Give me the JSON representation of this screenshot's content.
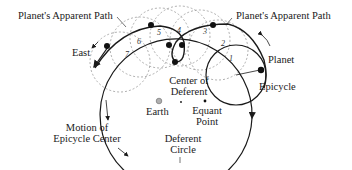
{
  "diagram": {
    "type": "ptolemaic-epicycle-model",
    "labels": {
      "apparent_path_left": "Planet's Apparent Path",
      "apparent_path_right": "Planet's Apparent Path",
      "east": "East",
      "planet": "Planet",
      "epicycle": "Epicycle",
      "center_of_deferent_line1": "Center of",
      "center_of_deferent_line2": "Deferent",
      "earth": "Earth",
      "equant_line1": "Equant",
      "equant_line2": "Point",
      "motion_line1": "Motion of",
      "motion_line2": "Epicycle Center",
      "deferent_line1": "Deferent",
      "deferent_line2": "Circle"
    },
    "epicycle_positions": [
      "1",
      "2",
      "3",
      "4",
      "5",
      "6",
      "7"
    ],
    "colors": {
      "line": "#1a1a1a",
      "dashed": "#9a9a9a",
      "earth_fill": "#b0b0b0"
    }
  }
}
